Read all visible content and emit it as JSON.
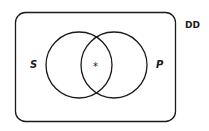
{
  "diagram": {
    "type": "venn",
    "universe_label": "DD",
    "sets": [
      {
        "name": "S",
        "label": "S"
      },
      {
        "name": "P",
        "label": "P"
      }
    ],
    "intersection_mark": "*",
    "stroke_color": "#1a1a1a",
    "background": "#ffffff"
  }
}
